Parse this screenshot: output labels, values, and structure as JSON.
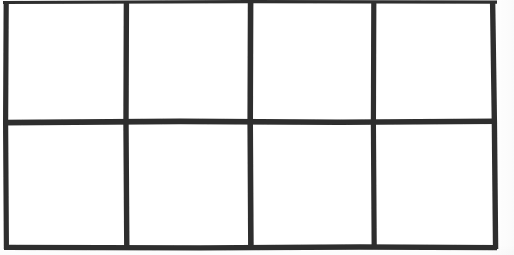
{
  "document": {
    "kind": "scanned-worksheet",
    "title": "Blank grid",
    "description": "Hand-drawn blank table: 2 rows by 4 columns, eight empty cells",
    "background_color": "#ffffff",
    "paper_color": "#fefefe"
  },
  "grid": {
    "rows": 2,
    "columns": 4,
    "cell_count": 8,
    "stroke_color": "#2e2e2e",
    "stroke_color_light": "#4a4a4a",
    "stroke_width_px": 5,
    "vertical_line_x": [
      4,
      125,
      250,
      373,
      494
    ],
    "horizontal_line_y": [
      2,
      122,
      247
    ],
    "top_edge_cropped": true,
    "cells": [
      {
        "id": "r1c1",
        "row": 1,
        "column": 1,
        "label": "",
        "x": 4,
        "y": 2,
        "w": 121,
        "h": 120
      },
      {
        "id": "r1c2",
        "row": 1,
        "column": 2,
        "label": "",
        "x": 125,
        "y": 2,
        "w": 125,
        "h": 120
      },
      {
        "id": "r1c3",
        "row": 1,
        "column": 3,
        "label": "",
        "x": 250,
        "y": 2,
        "w": 123,
        "h": 120
      },
      {
        "id": "r1c4",
        "row": 1,
        "column": 4,
        "label": "",
        "x": 373,
        "y": 2,
        "w": 121,
        "h": 120
      },
      {
        "id": "r2c1",
        "row": 2,
        "column": 1,
        "label": "",
        "x": 4,
        "y": 122,
        "w": 121,
        "h": 125
      },
      {
        "id": "r2c2",
        "row": 2,
        "column": 2,
        "label": "",
        "x": 125,
        "y": 122,
        "w": 125,
        "h": 125
      },
      {
        "id": "r2c3",
        "row": 2,
        "column": 3,
        "label": "",
        "x": 250,
        "y": 122,
        "w": 123,
        "h": 125
      },
      {
        "id": "r2c4",
        "row": 2,
        "column": 4,
        "label": "",
        "x": 373,
        "y": 122,
        "w": 121,
        "h": 125
      }
    ]
  }
}
